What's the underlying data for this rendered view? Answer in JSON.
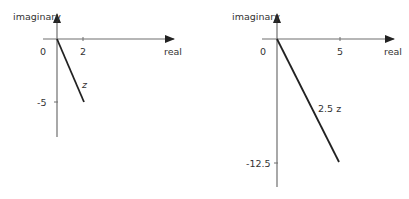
{
  "diagrams": [
    {
      "id": "left",
      "y_axis_label": "imaginary",
      "x_axis_label": "real",
      "origin_label": "0",
      "x_tick_label": "2",
      "y_tick_label": "-5",
      "vector_label": "z",
      "vector": {
        "real": 2,
        "imaginary": -5
      }
    },
    {
      "id": "right",
      "y_axis_label": "imaginary",
      "x_axis_label": "real",
      "origin_label": "0",
      "x_tick_label": "5",
      "y_tick_label": "-12.5",
      "vector_label": "2.5 z",
      "vector": {
        "real": 5,
        "imaginary": -12.5
      }
    }
  ],
  "colors": {
    "axis": "#6f6f6f",
    "vector": "#222222",
    "text": "#333333",
    "background": "#ffffff"
  }
}
